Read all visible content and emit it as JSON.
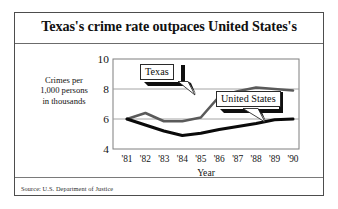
{
  "figure": {
    "title": "Texas's crime rate outpaces United States's",
    "source_label": "Source:",
    "source_text": "U.S. Department of Justice",
    "source_line": "Source:  U.S. Department of Justice",
    "border_color": "#4d4d4d"
  },
  "chart_data": {
    "type": "line",
    "title": "Texas's crime rate outpaces United States's",
    "xlabel": "Year",
    "ylabel": "Crimes per 1,000 persons in thousands",
    "ylabel_lines": [
      "Crimes per",
      "1,000 persons",
      "in thousands"
    ],
    "x": [
      "'81",
      "'82",
      "'83",
      "'84",
      "'85",
      "'86",
      "'87",
      "'88",
      "'89",
      "'90"
    ],
    "categories": [
      "'81",
      "'82",
      "'83",
      "'84",
      "'85",
      "'86",
      "'87",
      "'88",
      "'89",
      "'90"
    ],
    "xticklabels": [
      "'81",
      "'82",
      "'83",
      "'84",
      "'85",
      "'86",
      "'87",
      "'88",
      "'89",
      "'90"
    ],
    "yticklabels": [
      "10",
      "8",
      "6",
      "4"
    ],
    "yticks": [
      10,
      8,
      6,
      4
    ],
    "ylim": [
      4,
      10
    ],
    "grid": "horizontal gridlines at 8 and 6; frame box on all four sides",
    "legend": "inline callout boxes with leader pointers",
    "series": [
      {
        "name": "Texas",
        "color": "#5a5a5a",
        "width": 2.6,
        "values": [
          6.0,
          6.4,
          5.85,
          5.85,
          6.1,
          7.5,
          7.85,
          8.1,
          8.0,
          7.9
        ]
      },
      {
        "name": "United States",
        "color": "#0a0a0a",
        "width": 3.0,
        "values": [
          6.0,
          5.6,
          5.2,
          4.9,
          5.05,
          5.3,
          5.5,
          5.7,
          5.95,
          6.0
        ]
      }
    ],
    "annotations": [
      {
        "label": "Texas",
        "points_to_series": "Texas",
        "points_to_x": "'85"
      },
      {
        "label": "United States",
        "points_to_series": "United States",
        "points_to_x": "'89"
      }
    ]
  },
  "callouts": {
    "texas": "Texas",
    "united_states": "United States"
  },
  "axis": {
    "x_title": "Year"
  }
}
